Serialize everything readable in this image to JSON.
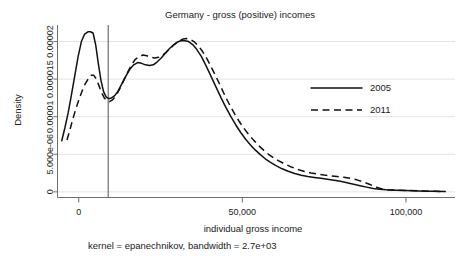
{
  "chart_data": {
    "type": "line",
    "title": "Germany - gross (positive) incomes",
    "xlabel": "individual gross income",
    "ylabel": "Density",
    "footnote": "kernel = epanechnikov, bandwidth =  2.7e+03",
    "xlim": [
      -6500,
      115000
    ],
    "ylim": [
      -7.5e-07,
      2.22e-05
    ],
    "xticks": [
      0,
      50000,
      100000
    ],
    "xticklabels": [
      "0",
      "50,000",
      "100,000"
    ],
    "yticks": [
      0,
      5e-06,
      1e-05,
      1.5e-05,
      2e-05
    ],
    "yticklabels": [
      "0",
      "5.000e-06",
      "0.00001",
      "0.000015",
      "0.00002"
    ],
    "grid": "horizontal",
    "legend_position": "right-middle",
    "annotations": [
      {
        "kind": "vertical-reference-line",
        "x": 9000
      }
    ],
    "series": [
      {
        "name": "2005",
        "style": "solid",
        "color": "#111111",
        "points": [
          [
            -5200,
            6.8e-06
          ],
          [
            -4200,
            8.6e-06
          ],
          [
            -3200,
            1.06e-05
          ],
          [
            -2200,
            1.3e-05
          ],
          [
            -1200,
            1.55e-05
          ],
          [
            -200,
            1.8e-05
          ],
          [
            800,
            2e-05
          ],
          [
            1800,
            2.1e-05
          ],
          [
            2800,
            2.13e-05
          ],
          [
            3600,
            2.13e-05
          ],
          [
            4400,
            2.11e-05
          ],
          [
            5200,
            1.95e-05
          ],
          [
            6000,
            1.7e-05
          ],
          [
            6800,
            1.48e-05
          ],
          [
            7600,
            1.33e-05
          ],
          [
            8400,
            1.26e-05
          ],
          [
            9200,
            1.24e-05
          ],
          [
            10000,
            1.25e-05
          ],
          [
            11000,
            1.28e-05
          ],
          [
            12000,
            1.34e-05
          ],
          [
            13200,
            1.44e-05
          ],
          [
            14400,
            1.54e-05
          ],
          [
            15600,
            1.63e-05
          ],
          [
            16800,
            1.69e-05
          ],
          [
            18000,
            1.72e-05
          ],
          [
            19200,
            1.71e-05
          ],
          [
            20400,
            1.69e-05
          ],
          [
            21600,
            1.68e-05
          ],
          [
            22800,
            1.69e-05
          ],
          [
            24000,
            1.73e-05
          ],
          [
            25200,
            1.78e-05
          ],
          [
            26400,
            1.84e-05
          ],
          [
            27600,
            1.9e-05
          ],
          [
            28800,
            1.95e-05
          ],
          [
            30000,
            1.99e-05
          ],
          [
            31200,
            2.01e-05
          ],
          [
            32400,
            2.01e-05
          ],
          [
            33600,
            2e-05
          ],
          [
            34800,
            1.96e-05
          ],
          [
            36000,
            1.9e-05
          ],
          [
            37500,
            1.8e-05
          ],
          [
            39000,
            1.67e-05
          ],
          [
            40500,
            1.53e-05
          ],
          [
            42000,
            1.39e-05
          ],
          [
            43500,
            1.25e-05
          ],
          [
            45000,
            1.12e-05
          ],
          [
            46500,
            1e-05
          ],
          [
            48000,
            8.9e-06
          ],
          [
            49500,
            7.9e-06
          ],
          [
            51000,
            7e-06
          ],
          [
            52500,
            6.25e-06
          ],
          [
            54000,
            5.55e-06
          ],
          [
            55500,
            4.95e-06
          ],
          [
            57000,
            4.4e-06
          ],
          [
            58500,
            3.95e-06
          ],
          [
            60000,
            3.55e-06
          ],
          [
            62000,
            3.1e-06
          ],
          [
            64000,
            2.75e-06
          ],
          [
            66000,
            2.45e-06
          ],
          [
            68000,
            2.22e-06
          ],
          [
            70000,
            2.05e-06
          ],
          [
            72000,
            1.92e-06
          ],
          [
            74000,
            1.8e-06
          ],
          [
            76000,
            1.68e-06
          ],
          [
            78000,
            1.55e-06
          ],
          [
            80000,
            1.4e-06
          ],
          [
            82000,
            1.22e-06
          ],
          [
            84000,
            1.02e-06
          ],
          [
            86000,
            8.2e-07
          ],
          [
            88000,
            6.3e-07
          ],
          [
            90000,
            4.6e-07
          ],
          [
            92000,
            3.4e-07
          ],
          [
            94000,
            2.8e-07
          ],
          [
            97000,
            2.2e-07
          ],
          [
            100000,
            1.8e-07
          ],
          [
            104000,
            1.3e-07
          ],
          [
            108000,
            8e-08
          ],
          [
            112000,
            4e-08
          ]
        ]
      },
      {
        "name": "2011",
        "style": "dashed",
        "color": "#111111",
        "points": [
          [
            -3600,
            6.9e-06
          ],
          [
            -2800,
            8.1e-06
          ],
          [
            -2000,
            9.4e-06
          ],
          [
            -1000,
            1.09e-05
          ],
          [
            0,
            1.22e-05
          ],
          [
            1000,
            1.34e-05
          ],
          [
            2000,
            1.44e-05
          ],
          [
            3000,
            1.51e-05
          ],
          [
            3800,
            1.55e-05
          ],
          [
            4600,
            1.55e-05
          ],
          [
            5400,
            1.5e-05
          ],
          [
            6200,
            1.41e-05
          ],
          [
            7000,
            1.32e-05
          ],
          [
            7800,
            1.25e-05
          ],
          [
            8600,
            1.21e-05
          ],
          [
            9400,
            1.2e-05
          ],
          [
            10200,
            1.22e-05
          ],
          [
            11200,
            1.27e-05
          ],
          [
            12400,
            1.36e-05
          ],
          [
            13600,
            1.47e-05
          ],
          [
            14800,
            1.58e-05
          ],
          [
            16000,
            1.68e-05
          ],
          [
            17200,
            1.76e-05
          ],
          [
            18400,
            1.8e-05
          ],
          [
            19600,
            1.82e-05
          ],
          [
            20800,
            1.81e-05
          ],
          [
            22000,
            1.79e-05
          ],
          [
            23200,
            1.78e-05
          ],
          [
            24400,
            1.79e-05
          ],
          [
            25600,
            1.82e-05
          ],
          [
            26800,
            1.86e-05
          ],
          [
            28000,
            1.91e-05
          ],
          [
            29200,
            1.96e-05
          ],
          [
            30400,
            2e-05
          ],
          [
            31600,
            2.03e-05
          ],
          [
            32800,
            2.04e-05
          ],
          [
            34000,
            2.03e-05
          ],
          [
            35200,
            2e-05
          ],
          [
            36400,
            1.95e-05
          ],
          [
            37800,
            1.87e-05
          ],
          [
            39200,
            1.77e-05
          ],
          [
            40600,
            1.65e-05
          ],
          [
            42000,
            1.53e-05
          ],
          [
            43400,
            1.4e-05
          ],
          [
            44800,
            1.27e-05
          ],
          [
            46200,
            1.15e-05
          ],
          [
            47600,
            1.04e-05
          ],
          [
            49000,
            9.4e-06
          ],
          [
            50500,
            8.45e-06
          ],
          [
            52000,
            7.6e-06
          ],
          [
            53500,
            6.85e-06
          ],
          [
            55000,
            6.15e-06
          ],
          [
            56500,
            5.55e-06
          ],
          [
            58000,
            5e-06
          ],
          [
            59500,
            4.55e-06
          ],
          [
            61000,
            4.15e-06
          ],
          [
            63000,
            3.7e-06
          ],
          [
            65000,
            3.3e-06
          ],
          [
            67000,
            2.98e-06
          ],
          [
            69000,
            2.72e-06
          ],
          [
            71000,
            2.52e-06
          ],
          [
            73000,
            2.36e-06
          ],
          [
            75000,
            2.24e-06
          ],
          [
            77000,
            2.14e-06
          ],
          [
            79000,
            2.04e-06
          ],
          [
            81000,
            1.94e-06
          ],
          [
            83000,
            1.8e-06
          ],
          [
            85000,
            1.6e-06
          ],
          [
            87000,
            1.32e-06
          ],
          [
            89000,
            9.8e-07
          ],
          [
            91000,
            6.2e-07
          ],
          [
            93000,
            3.6e-07
          ],
          [
            95000,
            2.6e-07
          ],
          [
            98000,
            2.1e-07
          ],
          [
            101000,
            1.7e-07
          ],
          [
            105000,
            1.2e-07
          ],
          [
            109000,
            7e-08
          ],
          [
            112000,
            4e-08
          ]
        ]
      }
    ]
  },
  "legend": {
    "items": [
      {
        "label": "2005",
        "style": "solid"
      },
      {
        "label": "2011",
        "style": "dashed"
      }
    ]
  }
}
